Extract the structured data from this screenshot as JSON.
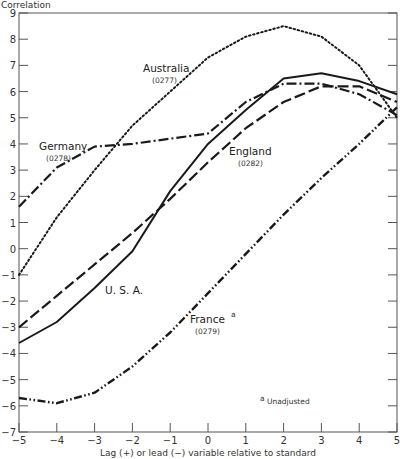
{
  "chart_data": {
    "type": "line",
    "title": "",
    "xlabel": "Lag (+) or lead (−) variable relative to standard",
    "ylabel": "Correlation",
    "x": [
      -5,
      -4,
      -3,
      -2,
      -1,
      0,
      1,
      2,
      3,
      4,
      5
    ],
    "xlim": [
      -5,
      5
    ],
    "ylim": [
      -7,
      9
    ],
    "x_ticks": [
      "-5",
      "-4",
      "-3",
      "-2",
      "-1",
      "0",
      "1",
      "2",
      "3",
      "4",
      "5"
    ],
    "y_ticks": [
      "9",
      "8",
      "7",
      "6",
      "5",
      "4",
      "3",
      "2",
      "1",
      "0",
      "-1",
      "-2",
      "-3",
      "-4",
      "-5",
      "-6",
      "-7"
    ],
    "grid": false,
    "legend": "inline labels",
    "series": [
      {
        "name": "Australia",
        "code": "(0277)",
        "style": "dotted",
        "values": [
          -1.0,
          1.2,
          3.0,
          4.7,
          6.0,
          7.3,
          8.1,
          8.5,
          8.1,
          7.0,
          5.0
        ]
      },
      {
        "name": "Germany",
        "code": "(0278)",
        "style": "dash-dot",
        "values": [
          1.6,
          3.1,
          3.9,
          4.0,
          4.2,
          4.4,
          5.6,
          6.3,
          6.3,
          5.9,
          5.1
        ]
      },
      {
        "name": "England",
        "code": "(0282)",
        "style": "long-dash",
        "values": [
          -3.0,
          -1.8,
          -0.6,
          0.6,
          1.9,
          3.3,
          4.6,
          5.6,
          6.2,
          6.2,
          5.6
        ]
      },
      {
        "name": "U.S.A.",
        "code": "",
        "style": "solid",
        "values": [
          -3.6,
          -2.8,
          -1.5,
          -0.1,
          2.2,
          4.0,
          5.3,
          6.5,
          6.7,
          6.4,
          5.9
        ]
      },
      {
        "name": "France",
        "code": "(0279)",
        "style": "dash-dot-dot",
        "superscript": "a",
        "values": [
          -5.7,
          -5.9,
          -5.5,
          -4.5,
          -3.2,
          -1.7,
          -0.2,
          1.3,
          2.7,
          4.0,
          5.4
        ]
      }
    ],
    "annotations": [
      {
        "text": "Unadjusted",
        "marker": "a"
      }
    ]
  },
  "labels": {
    "y_axis_title": "Correlation",
    "x_axis_title": "Lag (+) or lead (−) variable relative to standard",
    "footnote_marker": "a",
    "footnote_text": "Unadjusted",
    "australia": "Australia",
    "australia_code": "(0277)",
    "germany": "Germany",
    "germany_code": "(0278)",
    "england": "England",
    "england_code": "(0282)",
    "usa": "U. S. A.",
    "france": "France",
    "france_sup": "a",
    "france_code": "(0279)"
  },
  "colors": {
    "line": "#1a1a1a",
    "axis": "#555555",
    "background": "#ffffff"
  }
}
